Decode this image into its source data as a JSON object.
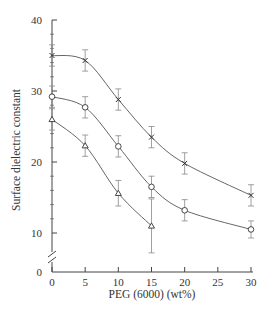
{
  "chart_data": {
    "type": "line",
    "title": "",
    "xlabel": "PEG (6000) (wt%)",
    "ylabel": "Surface dielectric constant",
    "xlim": [
      0,
      30
    ],
    "ylim": [
      0,
      40
    ],
    "y_axis_break": true,
    "x_ticks": [
      0,
      5,
      10,
      15,
      20,
      25,
      30
    ],
    "y_ticks": [
      0,
      10,
      20,
      30,
      40
    ],
    "grid": false,
    "legend": "none",
    "series": [
      {
        "name": "cross",
        "marker": "x",
        "x": [
          0,
          5,
          10,
          15,
          20,
          30
        ],
        "values": [
          35.0,
          34.3,
          28.8,
          23.5,
          19.8,
          15.3
        ],
        "error": [
          1.5,
          1.5,
          1.5,
          1.5,
          1.5,
          1.5
        ]
      },
      {
        "name": "circle",
        "marker": "o",
        "x": [
          0,
          5,
          10,
          15,
          20,
          30
        ],
        "values": [
          29.2,
          27.7,
          22.2,
          16.5,
          13.2,
          10.5
        ],
        "error": [
          1.5,
          1.5,
          1.5,
          1.5,
          1.5,
          1.2
        ]
      },
      {
        "name": "triangle",
        "marker": "^",
        "x": [
          0,
          5,
          10,
          15
        ],
        "values": [
          26.0,
          22.3,
          15.6,
          11.0
        ],
        "error": [
          1.5,
          1.5,
          1.8,
          3.8
        ]
      }
    ]
  },
  "labels": {
    "xlabel": "PEG (6000) (wt%)",
    "ylabel": "Surface dielectric constant",
    "x_ticks": [
      "0",
      "5",
      "10",
      "15",
      "20",
      "25",
      "30"
    ],
    "y_ticks": [
      "0",
      "10",
      "20",
      "30",
      "40"
    ]
  }
}
